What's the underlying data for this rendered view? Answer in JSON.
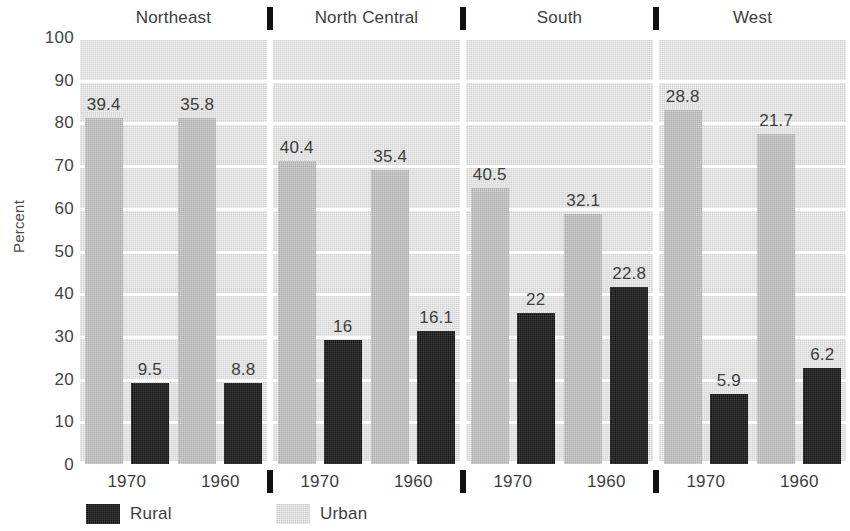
{
  "chart_data": {
    "type": "bar",
    "title": "",
    "subtitle": "",
    "xlabel": "",
    "ylabel": "Percent",
    "ylim": [
      0,
      100
    ],
    "ytick_step": 10,
    "ytick_labels": [
      "100",
      "90",
      "80",
      "70",
      "60",
      "50",
      "40",
      "30",
      "20",
      "10",
      "0"
    ],
    "grid": true,
    "legend_position": "bottom-left",
    "legend": [
      {
        "name": "Rural",
        "color": "#121212"
      },
      {
        "name": "Urban",
        "color": "#c9c9c9"
      }
    ],
    "panel_separator_glyph": "vertical-bar-tick",
    "panels": [
      {
        "name": "Northeast",
        "groups": [
          {
            "category": "1970",
            "bars": [
              {
                "series": "Urban",
                "percent": 81.0,
                "label": "39.4"
              },
              {
                "series": "Rural",
                "percent": 19.0,
                "label": "9.5"
              }
            ]
          },
          {
            "category": "1960",
            "bars": [
              {
                "series": "Urban",
                "percent": 81.0,
                "label": "35.8"
              },
              {
                "series": "Rural",
                "percent": 19.0,
                "label": "8.8"
              }
            ]
          }
        ]
      },
      {
        "name": "North Central",
        "groups": [
          {
            "category": "1970",
            "bars": [
              {
                "series": "Urban",
                "percent": 71.0,
                "label": "40.4"
              },
              {
                "series": "Rural",
                "percent": 29.0,
                "label": "16"
              }
            ]
          },
          {
            "category": "1960",
            "bars": [
              {
                "series": "Urban",
                "percent": 68.8,
                "label": "35.4"
              },
              {
                "series": "Rural",
                "percent": 31.2,
                "label": "16.1"
              }
            ]
          }
        ]
      },
      {
        "name": "South",
        "groups": [
          {
            "category": "1970",
            "bars": [
              {
                "series": "Urban",
                "percent": 64.6,
                "label": "40.5"
              },
              {
                "series": "Rural",
                "percent": 35.4,
                "label": "22"
              }
            ]
          },
          {
            "category": "1960",
            "bars": [
              {
                "series": "Urban",
                "percent": 58.5,
                "label": "32.1"
              },
              {
                "series": "Rural",
                "percent": 41.5,
                "label": "22.8"
              }
            ]
          }
        ]
      },
      {
        "name": "West",
        "groups": [
          {
            "category": "1970",
            "bars": [
              {
                "series": "Urban",
                "percent": 83.0,
                "label": "28.8"
              },
              {
                "series": "Rural",
                "percent": 16.5,
                "label": "5.9"
              }
            ]
          },
          {
            "category": "1960",
            "bars": [
              {
                "series": "Urban",
                "percent": 77.3,
                "label": "21.7"
              },
              {
                "series": "Rural",
                "percent": 22.4,
                "label": "6.2"
              }
            ]
          }
        ]
      }
    ]
  }
}
